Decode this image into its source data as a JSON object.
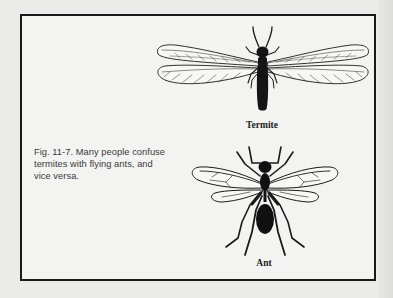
{
  "figure": {
    "caption": "Fig. 11-7. Many people confuse termites with flying ants, and vice versa.",
    "caption_lines": [
      "Fig. 11-7. Many people confuse",
      "termites with flying ants, and",
      "vice versa."
    ],
    "illustrations": [
      {
        "name": "termite",
        "label": "Termite",
        "icon": "termite-illustration"
      },
      {
        "name": "ant",
        "label": "Ant",
        "icon": "winged-ant-illustration"
      }
    ]
  },
  "colors": {
    "background": "#ebebea",
    "box_fill": "#f3f3f1",
    "ink": "#1a1a1a",
    "caption_text": "#3a3a3a"
  }
}
